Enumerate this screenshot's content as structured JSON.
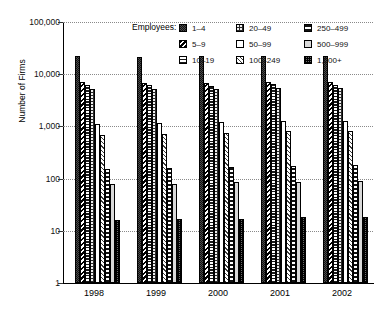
{
  "chart_data": {
    "type": "bar",
    "title": "",
    "xlabel": "",
    "ylabel": "Number of Firms",
    "yscale": "log",
    "ylim": [
      1,
      100000
    ],
    "grid": true,
    "legend_position": "top-center",
    "legend_title": "Employees:",
    "categories": [
      "1998",
      "1999",
      "2000",
      "2001",
      "2002"
    ],
    "ytick_labels": [
      "100,000",
      "10,000",
      "1,000",
      "100",
      "10",
      "1"
    ],
    "ytick_values": [
      100000,
      10000,
      1000,
      100,
      10,
      1
    ],
    "series": [
      {
        "name": "1–4",
        "pattern": "dense-dark-checker",
        "values": [
          22000,
          21500,
          22000,
          22500,
          22000
        ]
      },
      {
        "name": "5–9",
        "pattern": "back-diagonal",
        "values": [
          7000,
          6900,
          6800,
          7200,
          7000
        ]
      },
      {
        "name": "10–19",
        "pattern": "horizontal-lines",
        "values": [
          6200,
          6100,
          6000,
          6400,
          6200
        ]
      },
      {
        "name": "20–49",
        "pattern": "dark-dots",
        "values": [
          5300,
          5200,
          5200,
          5500,
          5400
        ]
      },
      {
        "name": "50–99",
        "pattern": "solid-white",
        "values": [
          1100,
          1150,
          1200,
          1250,
          1250
        ]
      },
      {
        "name": "100–249",
        "pattern": "light-diagonal",
        "values": [
          700,
          730,
          760,
          800,
          820
        ]
      },
      {
        "name": "250–499",
        "pattern": "thick-horizontal",
        "values": [
          155,
          160,
          165,
          175,
          180
        ]
      },
      {
        "name": "500–999",
        "pattern": "grey-speckle",
        "values": [
          78,
          80,
          85,
          88,
          90
        ]
      },
      {
        "name": "1,000+",
        "pattern": "fine-checker",
        "values": [
          16,
          17,
          17,
          18,
          18
        ]
      }
    ]
  },
  "axis": {
    "y_title": "Number of Firms"
  }
}
